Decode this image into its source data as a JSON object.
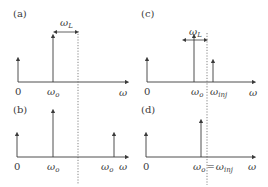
{
  "figure": {
    "panels": [
      {
        "id": "a",
        "label": "(a)",
        "origin_label": "0",
        "axis_label": "ω",
        "peak_label_main": "ω",
        "peak_label_sub": "o",
        "spacing_label_main": "ω",
        "spacing_label_sub": "L"
      },
      {
        "id": "b",
        "label": "(b)",
        "origin_label": "0",
        "axis_label": "ω",
        "peak_label_main": "ω",
        "peak_label_sub": "o",
        "second_peak_label_main": "ω",
        "second_peak_label_sub": "o"
      },
      {
        "id": "c",
        "label": "(c)",
        "origin_label": "0",
        "axis_label": "ω",
        "peak_label_main": "ω",
        "peak_label_sub": "o",
        "inj_label_main": "ω",
        "inj_label_sub": "inj",
        "spacing_label_main": "ω",
        "spacing_label_sub": "L"
      },
      {
        "id": "d",
        "label": "(d)",
        "origin_label": "0",
        "axis_label": "ω",
        "peak_label_main": "ω",
        "peak_label_sub": "o",
        "equals": "=",
        "inj_label_main": "ω",
        "inj_label_sub": "inj"
      }
    ],
    "colors": {
      "stroke": "#3a3a3a",
      "dotted": "#666666",
      "background": "#ffffff"
    }
  }
}
